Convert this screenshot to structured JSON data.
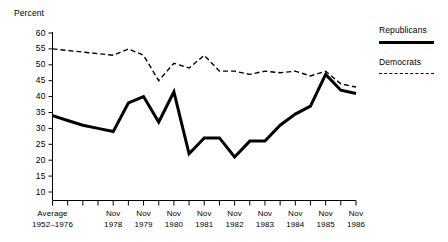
{
  "chart_data": {
    "type": "line",
    "title": "",
    "subtitle": "",
    "ylabel": "Percent",
    "xlabel": "",
    "ylim": [
      10,
      60
    ],
    "ytick_labels": [
      "60",
      "55",
      "50",
      "45",
      "40",
      "35",
      "30",
      "25",
      "20",
      "15",
      "10"
    ],
    "ytick_values": [
      60,
      55,
      50,
      45,
      40,
      35,
      30,
      25,
      20,
      15,
      10
    ],
    "grid": false,
    "legend_position": "right",
    "x_major_labels": [
      {
        "line1": "Average",
        "line2": "1952–1976",
        "index": 0
      },
      {
        "line1": "Nov",
        "line2": "1978",
        "index": 4
      },
      {
        "line1": "Nov",
        "line2": "1979",
        "index": 6
      },
      {
        "line1": "Nov",
        "line2": "1980",
        "index": 8
      },
      {
        "line1": "Nov",
        "line2": "1981",
        "index": 10
      },
      {
        "line1": "Nov",
        "line2": "1982",
        "index": 12
      },
      {
        "line1": "Nov",
        "line2": "1983",
        "index": 14
      },
      {
        "line1": "Nov",
        "line2": "1984",
        "index": 16
      },
      {
        "line1": "Nov",
        "line2": "1985",
        "index": 18
      },
      {
        "line1": "Nov",
        "line2": "1986",
        "index": 20
      }
    ],
    "x": [
      0,
      1,
      2,
      3,
      4,
      5,
      6,
      7,
      8,
      9,
      10,
      11,
      12,
      13,
      14,
      15,
      16,
      17,
      18,
      19,
      20
    ],
    "series": [
      {
        "name": "Republicans",
        "style": "solid",
        "color": "#000000",
        "values": [
          34,
          32.5,
          31,
          30,
          29,
          38,
          40,
          32,
          41.5,
          22,
          27,
          27,
          21,
          26,
          26,
          31,
          34.5,
          37,
          47,
          42,
          41
        ]
      },
      {
        "name": "Democrats",
        "style": "dashed",
        "color": "#000000",
        "values": [
          55,
          54.5,
          54,
          53.5,
          53,
          55,
          53,
          45,
          50.5,
          49,
          53,
          48,
          48,
          47,
          48,
          47.5,
          48,
          46.5,
          48,
          44,
          43
        ]
      }
    ]
  },
  "legend": {
    "items": [
      {
        "label": "Republicans",
        "style": "solid"
      },
      {
        "label": "Democrats",
        "style": "dashed"
      }
    ]
  }
}
